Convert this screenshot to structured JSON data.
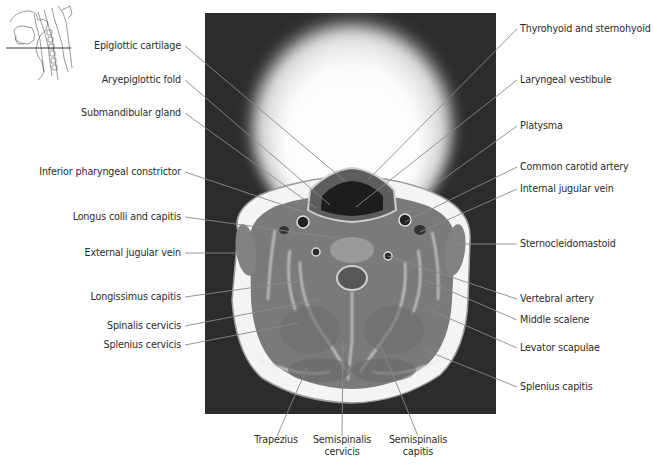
{
  "figure": {
    "type": "annotated axial MRI of the neck",
    "orientation_thumbnail": "sagittal head-neck sketch with horizontal section line"
  },
  "labels": {
    "left": [
      "Epiglottic cartilage",
      "Aryepiglottic fold",
      "Submandibular gland",
      "Inferior pharyngeal constrictor",
      "Longus colli and capitis",
      "External jugular vein",
      "Longissimus capitis",
      "Spinalis cervicis",
      "Splenius cervicis"
    ],
    "right": [
      "Thyrohyoid and sternohyoid",
      "Laryngeal vestibule",
      "Platysma",
      "Common carotid artery",
      "Internal jugular vein",
      "Sternocleidomastoid",
      "Vertebral artery",
      "Middle scalene",
      "Levator scapulae",
      "Splenius capitis"
    ],
    "bottom": [
      [
        "Trapezius"
      ],
      [
        "Semispinalis",
        "cervicis"
      ],
      [
        "Semispinalis",
        "capitis"
      ]
    ]
  },
  "colors": {
    "background": "#ffffff",
    "mri_frame": "#2c2c2c",
    "leader_line": "#8a8a8a",
    "label_text": "#2b2b2b"
  }
}
